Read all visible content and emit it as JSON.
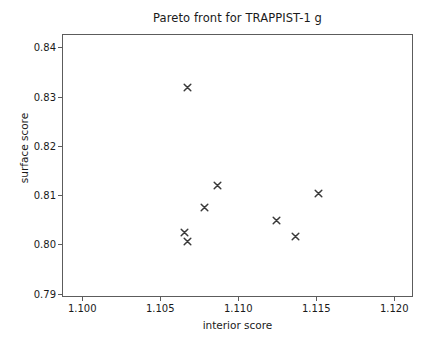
{
  "chart_data": {
    "type": "scatter",
    "title": "Pareto front for TRAPPIST-1 g",
    "xlabel": "interior score",
    "ylabel": "surface score",
    "xlim": [
      1.0987,
      1.1212
    ],
    "ylim": [
      0.7893,
      0.8427
    ],
    "xticks": [
      1.1,
      1.105,
      1.11,
      1.115,
      1.12
    ],
    "xticklabels": [
      "1.100",
      "1.105",
      "1.110",
      "1.115",
      "1.120"
    ],
    "yticks": [
      0.79,
      0.8,
      0.81,
      0.82,
      0.83,
      0.84
    ],
    "yticklabels": [
      "0.79",
      "0.80",
      "0.81",
      "0.82",
      "0.83",
      "0.84"
    ],
    "grid": false,
    "legend": null,
    "marker": "x",
    "marker_color": "#3a3a3a",
    "points": [
      {
        "x": 1.1067,
        "y": 0.8321
      },
      {
        "x": 1.1086,
        "y": 0.8122
      },
      {
        "x": 1.1151,
        "y": 0.8105
      },
      {
        "x": 1.1078,
        "y": 0.8076
      },
      {
        "x": 1.1124,
        "y": 0.8051
      },
      {
        "x": 1.1065,
        "y": 0.8025
      },
      {
        "x": 1.1136,
        "y": 0.8017
      },
      {
        "x": 1.1067,
        "y": 0.8007
      }
    ]
  },
  "colors": {
    "axis": "#5c5c5c",
    "text": "#1a1a1a",
    "marker": "#3a3a3a",
    "background": "#ffffff"
  }
}
